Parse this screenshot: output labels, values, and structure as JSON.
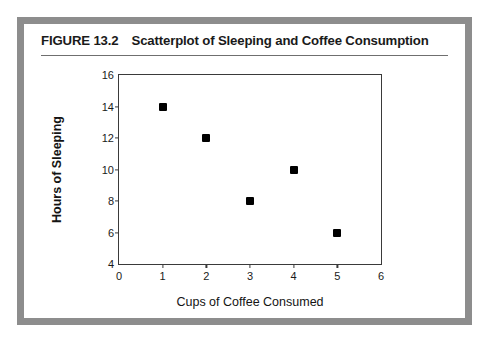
{
  "figure": {
    "number": "FIGURE 13.2",
    "title": "Scatterplot of Sleeping and Coffee Consumption",
    "border_color": "#8d8d8d",
    "background_color": "#ffffff"
  },
  "chart_data": {
    "type": "scatter",
    "title": "Scatterplot of Sleeping and Coffee Consumption",
    "xlabel": "Cups of Coffee Consumed",
    "ylabel": "Hours of Sleeping",
    "xlim": [
      0,
      6
    ],
    "ylim": [
      4,
      16
    ],
    "xticks": [
      0,
      1,
      2,
      3,
      4,
      5,
      6
    ],
    "yticks": [
      4,
      6,
      8,
      10,
      12,
      14,
      16
    ],
    "xtick_labels": [
      "0",
      "1",
      "2",
      "3",
      "4",
      "5",
      "6"
    ],
    "ytick_labels": [
      "4",
      "6",
      "8",
      "10",
      "12",
      "14",
      "16"
    ],
    "grid": false,
    "legend": false,
    "marker": "square",
    "marker_color": "#000000",
    "series": [
      {
        "name": "Participants",
        "points": [
          {
            "x": 1,
            "y": 14
          },
          {
            "x": 2,
            "y": 12
          },
          {
            "x": 3,
            "y": 8
          },
          {
            "x": 4,
            "y": 10
          },
          {
            "x": 5,
            "y": 6
          }
        ]
      }
    ]
  }
}
